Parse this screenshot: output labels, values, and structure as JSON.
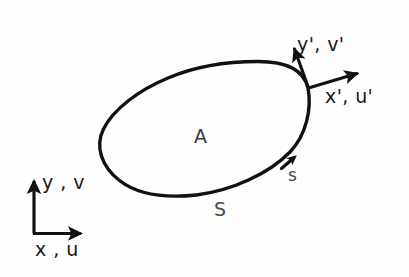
{
  "figure": {
    "type": "technical-diagram",
    "background_color": "#fefefe",
    "ink_color": "#111111"
  },
  "labels": {
    "area": "A",
    "arc_length_lower": "s",
    "curve_boundary_upper": "S",
    "local_y_axis": "y', v'",
    "local_x_axis": "x', u'",
    "global_y_axis": "y , v",
    "global_x_axis": "x , u"
  },
  "geometry": {
    "closed_curve": {
      "name": "S",
      "stroke_width": 3.4,
      "extremes": {
        "leftmost": [
          100,
          135
        ],
        "topmost": [
          225,
          63
        ],
        "rightmost": [
          311,
          120
        ],
        "bottommost": [
          189,
          196
        ]
      },
      "path": "M 308 88 C 304 72 288 62 258 62 C 230 62 196 66 168 78 C 138 91 113 110 103 130 C 95 147 101 166 119 180 C 140 196 168 198 196 195 C 232 191 268 174 290 152 C 306 136 312 110 308 88 Z"
    },
    "tangent_point": [
      308,
      88
    ],
    "arc_direction_marker": {
      "position": [
        288,
        163
      ],
      "note": "small arrowhead on curve indicating direction of increasing s"
    },
    "local_frame": {
      "origin": [
        308,
        88
      ],
      "y_prime_arrow": {
        "from": [
          308,
          88
        ],
        "to": [
          293,
          46
        ]
      },
      "x_prime_arrow": {
        "from": [
          308,
          88
        ],
        "to": [
          361,
          71
        ]
      }
    },
    "global_frame": {
      "corner": [
        34,
        233
      ],
      "y_axis_arrow": {
        "from": [
          34,
          233
        ],
        "to": [
          34,
          177
        ]
      },
      "x_axis_arrow": {
        "from": [
          34,
          233
        ],
        "to": [
          85,
          233
        ]
      },
      "stroke_width": 3.2
    }
  }
}
